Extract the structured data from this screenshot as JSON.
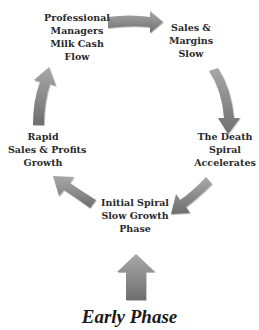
{
  "diagram": {
    "type": "cycle",
    "title": "Early Phase",
    "arrow_color": "#8a8a8a",
    "nodes": [
      {
        "id": "initial",
        "lines": [
          "Initial Spiral",
          "Slow Growth",
          "Phase"
        ]
      },
      {
        "id": "rapid",
        "lines": [
          "Rapid",
          "Sales & Profits",
          "Growth"
        ]
      },
      {
        "id": "professional",
        "lines": [
          "Professional",
          "Managers",
          "Milk Cash",
          "Flow"
        ]
      },
      {
        "id": "sales",
        "lines": [
          "Sales &",
          "Margins",
          "Slow"
        ]
      },
      {
        "id": "death",
        "lines": [
          "The Death",
          "Spiral",
          "Accelerates"
        ]
      }
    ],
    "edges": [
      {
        "from": "initial",
        "to": "rapid"
      },
      {
        "from": "rapid",
        "to": "professional"
      },
      {
        "from": "professional",
        "to": "sales"
      },
      {
        "from": "sales",
        "to": "death"
      },
      {
        "from": "death",
        "to": "initial"
      }
    ],
    "entry_arrow": {
      "to": "initial",
      "direction": "up"
    }
  }
}
